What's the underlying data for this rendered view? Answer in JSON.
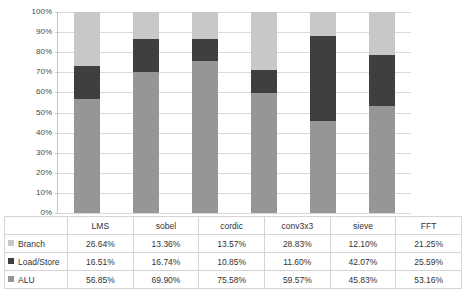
{
  "chart_data": {
    "type": "bar",
    "subtype": "100% stacked column",
    "title": "",
    "xlabel": "",
    "ylabel": "",
    "ylim": [
      0,
      100
    ],
    "ytick_labels": [
      "100%",
      "90%",
      "80%",
      "70%",
      "60%",
      "50%",
      "40%",
      "30%",
      "20%",
      "10%",
      "0%"
    ],
    "ytick_values": [
      100,
      90,
      80,
      70,
      60,
      50,
      40,
      30,
      20,
      10,
      0
    ],
    "grid": true,
    "legend_position": "data-table",
    "stack_order_bottom_to_top": [
      "ALU",
      "Load/Store",
      "Branch"
    ],
    "categories": [
      "LMS",
      "sobel",
      "cordic",
      "conv3x3",
      "sieve",
      "FFT"
    ],
    "series": [
      {
        "name": "Branch",
        "color": "#c8c8c8",
        "values": [
          26.64,
          13.36,
          13.57,
          28.83,
          12.1,
          21.25
        ],
        "labels": [
          "26.64%",
          "13.36%",
          "13.57%",
          "28.83%",
          "12.10%",
          "21.25%"
        ]
      },
      {
        "name": "Load/Store",
        "color": "#3f3f3f",
        "values": [
          16.51,
          16.74,
          10.85,
          11.6,
          42.07,
          25.59
        ],
        "labels": [
          "16.51%",
          "16.74%",
          "10.85%",
          "11.60%",
          "42.07%",
          "25.59%"
        ]
      },
      {
        "name": "ALU",
        "color": "#969696",
        "values": [
          56.85,
          69.9,
          75.58,
          59.57,
          45.83,
          53.16
        ],
        "labels": [
          "56.85%",
          "69.90%",
          "75.58%",
          "59.57%",
          "45.83%",
          "53.16%"
        ]
      }
    ]
  },
  "table": {
    "corner_label": "",
    "column_headers": [
      "LMS",
      "sobel",
      "cordic",
      "conv3x3",
      "sieve",
      "FFT"
    ],
    "rows": [
      {
        "label": "Branch",
        "swatch_color": "#c8c8c8",
        "values": [
          "26.64%",
          "13.36%",
          "13.57%",
          "28.83%",
          "12.10%",
          "21.25%"
        ]
      },
      {
        "label": "Load/Store",
        "swatch_color": "#3f3f3f",
        "values": [
          "16.51%",
          "16.74%",
          "10.85%",
          "11.60%",
          "42.07%",
          "25.59%"
        ]
      },
      {
        "label": "ALU",
        "swatch_color": "#969696",
        "values": [
          "56.85%",
          "69.90%",
          "75.58%",
          "59.57%",
          "45.83%",
          "53.16%"
        ]
      }
    ]
  },
  "colors": {
    "branch": "#c8c8c8",
    "load_store": "#3f3f3f",
    "alu": "#969696",
    "gridline": "#d9d9d9",
    "axis": "#c4c4c4",
    "table_border": "#d5d5d5",
    "background": "#ffffff"
  }
}
